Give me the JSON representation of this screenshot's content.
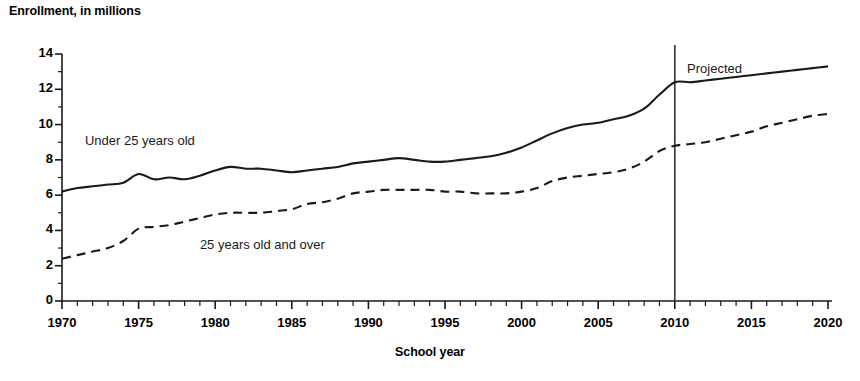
{
  "chart_data": {
    "type": "line",
    "title": "",
    "ylabel": "Enrollment, in millions",
    "xlabel": "School year",
    "xlim": [
      1970,
      2020
    ],
    "ylim": [
      0,
      14
    ],
    "ytick_labels": [
      "0",
      "2",
      "4",
      "6",
      "8",
      "10",
      "12",
      "14"
    ],
    "yticks": [
      0,
      2,
      4,
      6,
      8,
      10,
      12,
      14
    ],
    "y_minor_step": 1,
    "xtick_labels": [
      "1970",
      "1975",
      "1980",
      "1985",
      "1990",
      "1995",
      "2000",
      "2005",
      "2010",
      "2015",
      "2020"
    ],
    "xticks": [
      1970,
      1975,
      1980,
      1985,
      1990,
      1995,
      2000,
      2005,
      2010,
      2015,
      2020
    ],
    "x_minor_step": 1,
    "grid": false,
    "legend_position": "inline-annotations",
    "annotations": [
      {
        "text": "Under 25 years old",
        "x": 1971.5,
        "y": 9.0
      },
      {
        "text": "25 years old and over",
        "x": 1979.0,
        "y": 3.1
      },
      {
        "text": "Projected",
        "x": 2010.8,
        "y": 13.1
      }
    ],
    "projection_divider": {
      "x": 2010.0,
      "label": "Projected"
    },
    "x": [
      1970,
      1971,
      1972,
      1973,
      1974,
      1975,
      1976,
      1977,
      1978,
      1979,
      1980,
      1981,
      1982,
      1983,
      1984,
      1985,
      1986,
      1987,
      1988,
      1989,
      1990,
      1991,
      1992,
      1993,
      1994,
      1995,
      1996,
      1997,
      1998,
      1999,
      2000,
      2001,
      2002,
      2003,
      2004,
      2005,
      2006,
      2007,
      2008,
      2009,
      2010,
      2011,
      2012,
      2013,
      2014,
      2015,
      2016,
      2017,
      2018,
      2019,
      2020
    ],
    "series": [
      {
        "name": "Under 25 years old",
        "style": "solid",
        "color": "#1a1a1a",
        "values": [
          6.2,
          6.4,
          6.5,
          6.6,
          6.7,
          7.2,
          6.9,
          7.0,
          6.9,
          7.1,
          7.4,
          7.6,
          7.5,
          7.5,
          7.4,
          7.3,
          7.4,
          7.5,
          7.6,
          7.8,
          7.9,
          8.0,
          8.1,
          8.0,
          7.9,
          7.9,
          8.0,
          8.1,
          8.2,
          8.4,
          8.7,
          9.1,
          9.5,
          9.8,
          10.0,
          10.1,
          10.3,
          10.5,
          10.9,
          11.7,
          12.4,
          12.4,
          12.5,
          12.6,
          12.7,
          12.8,
          12.9,
          13.0,
          13.1,
          13.2,
          13.3
        ]
      },
      {
        "name": "25 years old and over",
        "style": "dashed",
        "color": "#1a1a1a",
        "values": [
          2.4,
          2.6,
          2.8,
          3.0,
          3.4,
          4.1,
          4.2,
          4.3,
          4.5,
          4.7,
          4.9,
          5.0,
          5.0,
          5.0,
          5.1,
          5.2,
          5.5,
          5.6,
          5.8,
          6.1,
          6.2,
          6.3,
          6.3,
          6.3,
          6.3,
          6.2,
          6.2,
          6.1,
          6.1,
          6.1,
          6.2,
          6.4,
          6.8,
          7.0,
          7.1,
          7.2,
          7.3,
          7.5,
          7.9,
          8.5,
          8.8,
          8.9,
          9.0,
          9.2,
          9.4,
          9.6,
          9.9,
          10.1,
          10.3,
          10.5,
          10.6
        ]
      }
    ]
  }
}
